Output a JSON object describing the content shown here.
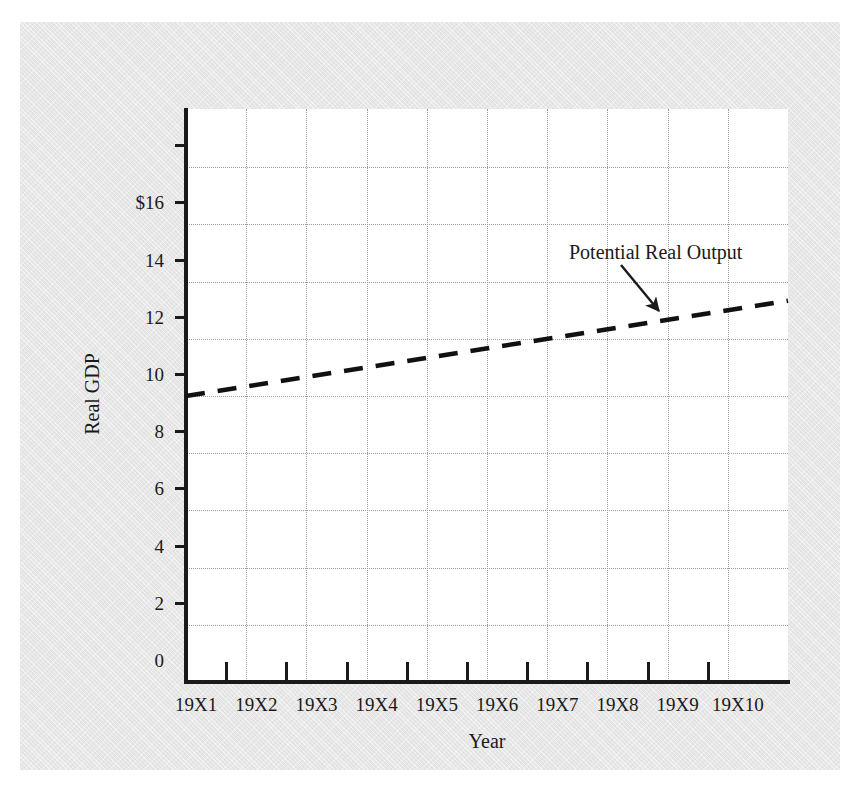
{
  "figure": {
    "background_color": "#e3e3e3",
    "plot_background_color": "#ffffff",
    "axis_color": "#1a1a1a",
    "gridline_color": "#9a9a9a",
    "series_color": "#111111"
  },
  "chart_data": {
    "type": "line",
    "title": "",
    "xlabel": "Year",
    "ylabel": "Real GDP",
    "categories": [
      "19X1",
      "19X2",
      "19X3",
      "19X4",
      "19X5",
      "19X6",
      "19X7",
      "19X8",
      "19X9",
      "19X10"
    ],
    "x_tick_labels": [
      "19X1",
      "19X2",
      "19X3",
      "19X4",
      "19X5",
      "19X6",
      "19X7",
      "19X8",
      "19X9",
      "19X10"
    ],
    "y_tick_labels": [
      "0",
      "2",
      "4",
      "6",
      "8",
      "10",
      "12",
      "14",
      "$16",
      ""
    ],
    "y_tick_values": [
      0,
      2,
      4,
      6,
      8,
      10,
      12,
      14,
      16,
      18
    ],
    "ylim": [
      0,
      19.4
    ],
    "grid": true,
    "grid_style": "dotted",
    "legend": "none",
    "series": [
      {
        "name": "Potential Real Output",
        "line_style": "dashed",
        "values": [
          10.0,
          10.37,
          10.74,
          11.11,
          11.48,
          11.85,
          12.22,
          12.59,
          12.96,
          13.33
        ]
      }
    ],
    "annotations": [
      {
        "text": "Potential Real Output",
        "arrow": true,
        "points_to_year": "19X8",
        "points_to_value": 12.6
      }
    ]
  },
  "axis_labels": {
    "y_title": "Real GDP",
    "x_title": "Year"
  },
  "annotation": {
    "text": "Potential Real Output"
  }
}
